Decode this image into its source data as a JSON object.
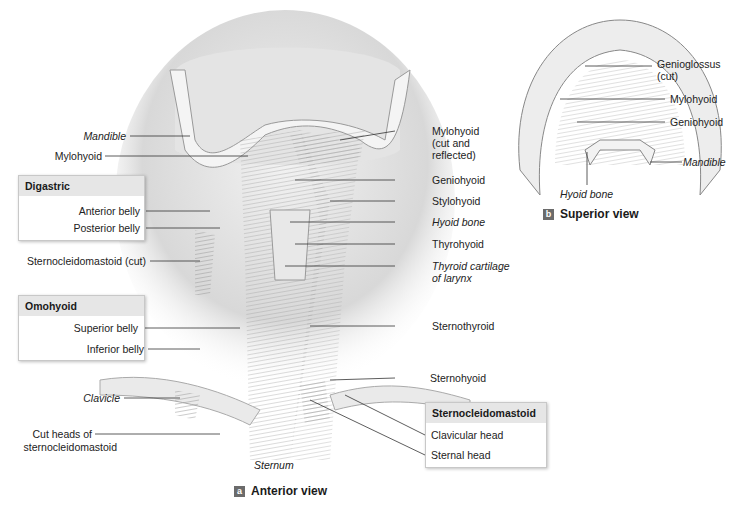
{
  "figure_a": {
    "badge": "a",
    "caption": "Anterior view",
    "labels_left": {
      "mandible": "Mandible",
      "mylohyoid": "Mylohyoid",
      "scm_cut": "Sternocleidomastoid (cut)",
      "clavicle": "Clavicle",
      "cut_heads_1": "Cut heads of",
      "cut_heads_2": "sternocleidomastoid"
    },
    "digastric_box": {
      "title": "Digastric",
      "items": [
        "Anterior belly",
        "Posterior belly"
      ]
    },
    "omohyoid_box": {
      "title": "Omohyoid",
      "items": [
        "Superior belly",
        "Inferior belly"
      ]
    },
    "labels_right": {
      "mylohyoid_1": "Mylohyoid",
      "mylohyoid_2": "(cut and",
      "mylohyoid_3": "reflected)",
      "geniohyoid": "Geniohyoid",
      "stylohyoid": "Stylohyoid",
      "hyoid_bone": "Hyoid bone",
      "thyrohyoid": "Thyrohyoid",
      "thyroid_cart_1": "Thyroid cartilage",
      "thyroid_cart_2": "of larynx",
      "sternothyroid": "Sternothyroid",
      "sternohyoid": "Sternohyoid"
    },
    "scm_box": {
      "title": "Sternocleidomastoid",
      "items": [
        "Clavicular head",
        "Sternal head"
      ]
    },
    "sternum": "Sternum"
  },
  "figure_b": {
    "badge": "b",
    "caption": "Superior view",
    "labels": {
      "genioglossus_1": "Genioglossus",
      "genioglossus_2": "(cut)",
      "mylohyoid": "Mylohyoid",
      "geniohyoid": "Geniohyoid",
      "mandible": "Mandible",
      "hyoid_bone": "Hyoid bone"
    }
  }
}
